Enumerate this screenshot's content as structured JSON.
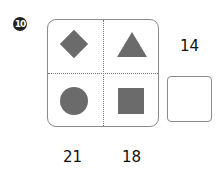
{
  "problem": {
    "number": "10",
    "badge_glyph": "⑩",
    "shapes": [
      "diamond",
      "triangle",
      "circle",
      "square"
    ],
    "shape_color": "#6b6b6b",
    "right_label": "14",
    "bottom_labels": [
      "21",
      "18"
    ],
    "answer_value": ""
  }
}
